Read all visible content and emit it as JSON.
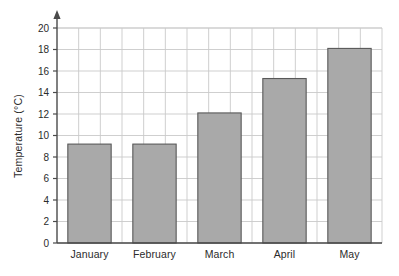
{
  "chart_data": {
    "type": "bar",
    "title": "",
    "subtitle": "",
    "xlabel": "",
    "ylabel": "Temperature (°C)",
    "categories": [
      "January",
      "February",
      "March",
      "April",
      "May"
    ],
    "values": [
      9.2,
      9.2,
      12.1,
      15.3,
      18.1
    ],
    "series": [
      {
        "name": "Temperature",
        "values": [
          9.2,
          9.2,
          12.1,
          15.3,
          18.1
        ]
      }
    ],
    "ylim": [
      0,
      20
    ],
    "xlim": [
      0,
      5
    ],
    "y_ticks": [
      0,
      2,
      4,
      6,
      8,
      10,
      12,
      14,
      16,
      18,
      20
    ],
    "y_tick_labels": [
      "0",
      "2",
      "4",
      "6",
      "8",
      "10",
      "12",
      "14",
      "16",
      "18",
      "20"
    ],
    "y_tick_step": 2,
    "grid": true,
    "grid_horizontal": true,
    "grid_vertical": true,
    "vertical_grid_columns": 15,
    "legend": false,
    "legend_position": "none",
    "y_axis_arrow": true,
    "colors": {
      "bar_fill": "#a9a9a9",
      "bar_stroke": "#595959",
      "grid_line": "#c9c9c9",
      "axis_line": "#4a4a4a",
      "text": "#2b2b2b",
      "background": "#ffffff"
    },
    "units": "°C",
    "annotations": []
  },
  "axes": {
    "y_title": "Temperature (°C)",
    "y_min_label": "0",
    "y_max_label": "20"
  }
}
